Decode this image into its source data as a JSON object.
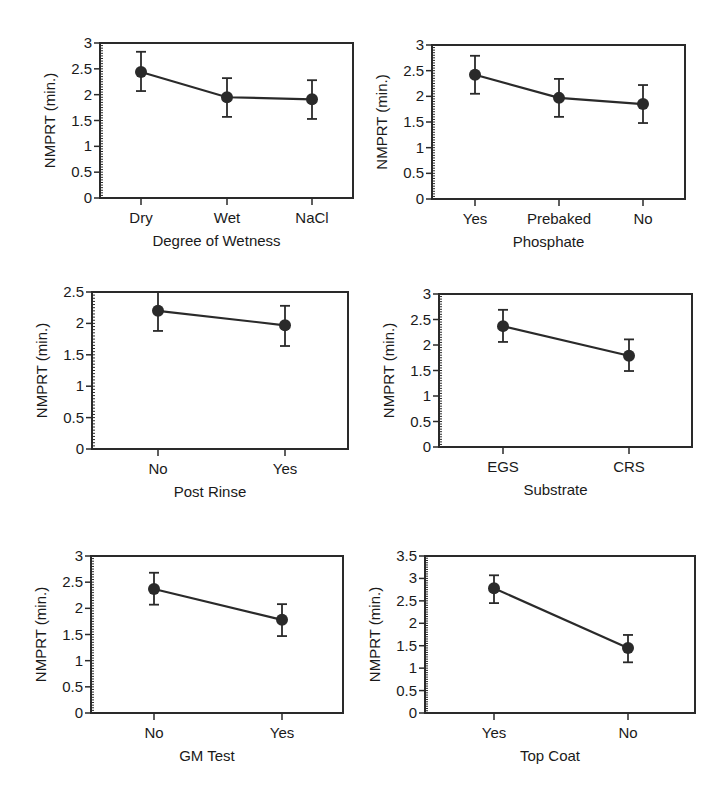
{
  "figure": {
    "y_axis_label": "NMPRT (min.)",
    "line_color": "#2a2a2a",
    "marker_color": "#2a2a2a"
  },
  "chart_data": [
    {
      "type": "line",
      "title": "",
      "xlabel": "Degree of Wetness",
      "ylabel": "NMPRT (min.)",
      "categories": [
        "Dry",
        "Wet",
        "NaCl"
      ],
      "values": [
        2.44,
        1.95,
        1.91
      ],
      "error_upper": [
        2.83,
        2.32,
        2.28
      ],
      "error_lower": [
        2.07,
        1.57,
        1.53
      ],
      "ylim": [
        0,
        3
      ],
      "yticks": [
        0,
        0.5,
        1,
        1.5,
        2,
        2.5,
        3
      ],
      "ytick_labels": [
        "0",
        "0.5",
        "1",
        "1.5",
        "2",
        "2.5",
        "3"
      ],
      "grid": false,
      "layout": {
        "left": 100,
        "right": 353,
        "top": 43,
        "bottom": 198,
        "cat_x": [
          141,
          227,
          312
        ]
      }
    },
    {
      "type": "line",
      "title": "",
      "xlabel": "Phosphate",
      "ylabel": "NMPRT (min.)",
      "categories": [
        "Yes",
        "Prebaked",
        "No"
      ],
      "values": [
        2.42,
        1.97,
        1.85
      ],
      "error_upper": [
        2.79,
        2.34,
        2.22
      ],
      "error_lower": [
        2.05,
        1.6,
        1.48
      ],
      "ylim": [
        0,
        3
      ],
      "yticks": [
        0,
        0.5,
        1,
        1.5,
        2,
        2.5,
        3
      ],
      "ytick_labels": [
        "0",
        "0.5",
        "1",
        "1.5",
        "2",
        "2.5",
        "3"
      ],
      "grid": false,
      "layout": {
        "left": 432,
        "right": 685,
        "top": 45,
        "bottom": 199,
        "cat_x": [
          475,
          559,
          643
        ]
      }
    },
    {
      "type": "line",
      "title": "",
      "xlabel": "Post Rinse",
      "ylabel": "NMPRT (min.)",
      "categories": [
        "No",
        "Yes"
      ],
      "values": [
        2.2,
        1.97
      ],
      "error_upper": [
        2.5,
        2.28
      ],
      "error_lower": [
        1.88,
        1.64
      ],
      "ylim": [
        0,
        2.5
      ],
      "yticks": [
        0,
        0.5,
        1,
        1.5,
        2,
        2.5
      ],
      "ytick_labels": [
        "0",
        "0.5",
        "1",
        "1.5",
        "2",
        "2.5"
      ],
      "grid": false,
      "layout": {
        "left": 92,
        "right": 348,
        "top": 292,
        "bottom": 449,
        "cat_x": [
          158,
          285
        ]
      }
    },
    {
      "type": "line",
      "title": "",
      "xlabel": "Substrate",
      "ylabel": "NMPRT (min.)",
      "categories": [
        "EGS",
        "CRS"
      ],
      "values": [
        2.37,
        1.79
      ],
      "error_upper": [
        2.69,
        2.11
      ],
      "error_lower": [
        2.06,
        1.49
      ],
      "ylim": [
        0,
        3
      ],
      "yticks": [
        0,
        0.5,
        1,
        1.5,
        2,
        2.5,
        3
      ],
      "ytick_labels": [
        "0",
        "0.5",
        "1",
        "1.5",
        "2",
        "2.5",
        "3"
      ],
      "grid": false,
      "layout": {
        "left": 439,
        "right": 692,
        "top": 294,
        "bottom": 447,
        "cat_x": [
          503,
          629
        ]
      }
    },
    {
      "type": "line",
      "title": "",
      "xlabel": "GM Test",
      "ylabel": "NMPRT (min.)",
      "categories": [
        "No",
        "Yes"
      ],
      "values": [
        2.37,
        1.78
      ],
      "error_upper": [
        2.68,
        2.08
      ],
      "error_lower": [
        2.07,
        1.47
      ],
      "ylim": [
        0,
        3
      ],
      "yticks": [
        0,
        0.5,
        1,
        1.5,
        2,
        2.5,
        3
      ],
      "ytick_labels": [
        "0",
        "0.5",
        "1",
        "1.5",
        "2",
        "2.5",
        "3"
      ],
      "grid": false,
      "layout": {
        "left": 91,
        "right": 343,
        "top": 556,
        "bottom": 713,
        "cat_x": [
          154,
          282
        ]
      }
    },
    {
      "type": "line",
      "title": "",
      "xlabel": "Top Coat",
      "ylabel": "NMPRT (min.)",
      "categories": [
        "Yes",
        "No"
      ],
      "values": [
        2.78,
        1.45
      ],
      "error_upper": [
        3.07,
        1.74
      ],
      "error_lower": [
        2.45,
        1.13
      ],
      "ylim": [
        0,
        3.5
      ],
      "yticks": [
        0,
        0.5,
        1,
        1.5,
        2,
        2.5,
        3,
        3.5
      ],
      "ytick_labels": [
        "0",
        "0.5",
        "1",
        "1.5",
        "2",
        "2.5",
        "3",
        "3.5"
      ],
      "grid": false,
      "layout": {
        "left": 425,
        "right": 695,
        "top": 556,
        "bottom": 713,
        "cat_x": [
          494,
          628
        ]
      }
    }
  ]
}
